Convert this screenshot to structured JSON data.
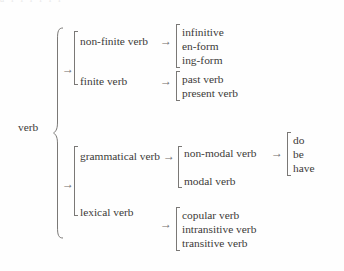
{
  "figure": {
    "cut_off_header_text": "a      i      i                    i              i i  i",
    "root": {
      "label": "verb"
    },
    "type": "taxonomy-tree",
    "levels": [
      {
        "name": "level-1",
        "nodes": [
          {
            "label": "non-finite verb"
          },
          {
            "label": "finite verb"
          },
          {
            "label": "grammatical verb"
          },
          {
            "label": "lexical verb"
          }
        ]
      },
      {
        "name": "level-2",
        "nodes": [
          {
            "label": "infinitive"
          },
          {
            "label": "en-form"
          },
          {
            "label": "ing-form"
          },
          {
            "label": "past verb"
          },
          {
            "label": "present verb"
          },
          {
            "label": "non-modal verb"
          },
          {
            "label": "modal verb"
          },
          {
            "label": "copular verb"
          },
          {
            "label": "intransitive verb"
          },
          {
            "label": "transitive verb"
          }
        ]
      },
      {
        "name": "level-3",
        "nodes": [
          {
            "label": "do"
          },
          {
            "label": "be"
          },
          {
            "label": "have"
          }
        ]
      }
    ],
    "groups": {
      "non_finite_forms": [
        "infinitive",
        "en-form",
        "ing-form"
      ],
      "finite_forms": [
        "past verb",
        "present verb"
      ],
      "grammatical_kinds": [
        "non-modal verb",
        "modal verb"
      ],
      "non_modal_members": [
        "do",
        "be",
        "have"
      ],
      "lexical_kinds": [
        "copular verb",
        "intransitive verb",
        "transitive verb"
      ],
      "root_children_group_a": [
        "non-finite verb",
        "finite verb"
      ],
      "root_children_group_b": [
        "grammatical verb",
        "lexical verb"
      ]
    },
    "arrow_glyph": "→",
    "colors": {
      "text": "#3c3a38",
      "rule": "#7a7876",
      "background": "#fefefe"
    }
  }
}
